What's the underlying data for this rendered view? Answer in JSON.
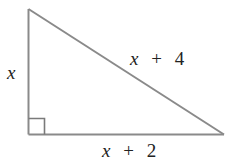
{
  "figure": {
    "type": "right-triangle",
    "colors": {
      "stroke": "#8a8a8a",
      "text": "#222222",
      "background": "#ffffff"
    },
    "vertices": {
      "top": [
        28.5,
        9
      ],
      "right_angle": [
        28.5,
        134.5
      ],
      "bottom_right": [
        224,
        134.5
      ]
    },
    "right_angle_marker": {
      "size": 16
    },
    "labels": {
      "left_leg": {
        "variable": "x",
        "operator": "",
        "constant": ""
      },
      "hypotenuse": {
        "variable": "x",
        "operator": "+",
        "constant": "4"
      },
      "bottom_leg": {
        "variable": "x",
        "operator": "+",
        "constant": "2"
      }
    }
  }
}
